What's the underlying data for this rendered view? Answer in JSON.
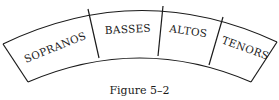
{
  "diagram": {
    "type": "seating-arc",
    "sections": [
      {
        "label": "SOPRANOS"
      },
      {
        "label": "BASSES"
      },
      {
        "label": "ALTOS"
      },
      {
        "label": "TENORS"
      }
    ],
    "caption": "Figure 5–2",
    "colors": {
      "stroke": "#1a1a1a",
      "background": "#ffffff"
    }
  }
}
